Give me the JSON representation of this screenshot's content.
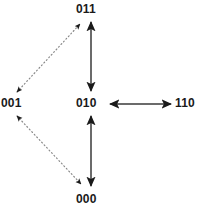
{
  "diagram": {
    "type": "state-transition-graph",
    "background_color": "#ffffff",
    "line_color": "#6b6b6b",
    "arrow_color": "#1a1a1a",
    "label_color": "#1a1a1a",
    "nodes": [
      {
        "id": "n011",
        "label": "011",
        "x": 91,
        "y": 9
      },
      {
        "id": "n001",
        "label": "001",
        "x": 14,
        "y": 103
      },
      {
        "id": "n010",
        "label": "010",
        "x": 91,
        "y": 103
      },
      {
        "id": "n110",
        "label": "110",
        "x": 188,
        "y": 103
      },
      {
        "id": "n000",
        "label": "000",
        "x": 91,
        "y": 199
      }
    ],
    "edges": [
      {
        "from": "011",
        "to": "010",
        "style": "solid",
        "heads": "both",
        "orientation": "vertical"
      },
      {
        "from": "010",
        "to": "000",
        "style": "solid",
        "heads": "both",
        "orientation": "vertical"
      },
      {
        "from": "010",
        "to": "110",
        "style": "solid",
        "heads": "both",
        "orientation": "horizontal"
      },
      {
        "from": "001",
        "to": "011",
        "style": "dotted",
        "heads": "both",
        "orientation": "diagonal"
      },
      {
        "from": "001",
        "to": "000",
        "style": "dotted",
        "heads": "both",
        "orientation": "diagonal"
      }
    ]
  }
}
